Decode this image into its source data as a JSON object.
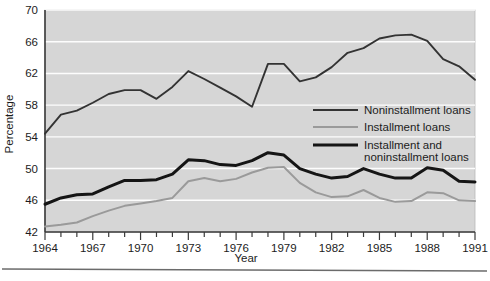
{
  "chart_data": {
    "type": "line",
    "title": "",
    "xlabel": "Year",
    "ylabel": "Percentage",
    "xlim": [
      1964,
      1991
    ],
    "ylim": [
      42,
      70
    ],
    "yticks": [
      42,
      46,
      50,
      54,
      58,
      62,
      66,
      70
    ],
    "xticks": [
      1964,
      1967,
      1970,
      1973,
      1976,
      1979,
      1982,
      1985,
      1988,
      1991
    ],
    "xtick_labels": [
      "1964",
      "1967",
      "1970",
      "1973",
      "1976",
      "1979",
      "1982",
      "1985",
      "1988",
      "1991"
    ],
    "ytick_labels": [
      "42",
      "46",
      "50",
      "54",
      "58",
      "62",
      "66",
      "70"
    ],
    "minor_xticks_every": 1,
    "grid": "horizontal-white-on-gray",
    "legend_position": "center-right",
    "x": [
      1964,
      1965,
      1966,
      1967,
      1968,
      1969,
      1970,
      1971,
      1972,
      1973,
      1974,
      1975,
      1976,
      1977,
      1978,
      1979,
      1980,
      1981,
      1982,
      1983,
      1984,
      1985,
      1986,
      1987,
      1988,
      1989,
      1990,
      1991
    ],
    "series": [
      {
        "name": "Noninstallment loans",
        "color": "#333333",
        "values": [
          54.4,
          56.8,
          57.3,
          58.3,
          59.4,
          59.9,
          59.9,
          58.8,
          60.3,
          62.3,
          61.3,
          60.2,
          59.1,
          57.8,
          63.2,
          63.2,
          61.0,
          61.5,
          62.8,
          64.6,
          65.2,
          66.4,
          66.8,
          66.9,
          66.1,
          63.8,
          62.9,
          61.2
        ]
      },
      {
        "name": "Installment loans",
        "color": "#9a9a9a",
        "values": [
          42.7,
          42.9,
          43.2,
          44.0,
          44.7,
          45.3,
          45.6,
          45.9,
          46.3,
          48.4,
          48.8,
          48.4,
          48.7,
          49.5,
          50.1,
          50.2,
          48.2,
          47.0,
          46.4,
          46.5,
          47.3,
          46.3,
          45.8,
          45.9,
          47.0,
          46.9,
          46.0,
          45.9
        ]
      },
      {
        "name": "Installment and\nnoninstallment loans",
        "color": "#151515",
        "values": [
          45.5,
          46.3,
          46.7,
          46.8,
          47.7,
          48.5,
          48.5,
          48.6,
          49.3,
          51.1,
          51.0,
          50.5,
          50.4,
          51.0,
          52.0,
          51.7,
          50.0,
          49.3,
          48.8,
          49.0,
          50.0,
          49.3,
          48.8,
          48.8,
          50.1,
          49.8,
          48.4,
          48.3
        ]
      }
    ]
  },
  "legend": {
    "items": [
      {
        "label": "Noninstallment loans",
        "color": "#333333"
      },
      {
        "label": "Installment loans",
        "color": "#9a9a9a"
      },
      {
        "label_line1": "Installment and",
        "label_line2": "noninstallment loans",
        "color": "#151515"
      }
    ]
  },
  "axes": {
    "y_title": "Percentage",
    "x_title": "Year"
  }
}
